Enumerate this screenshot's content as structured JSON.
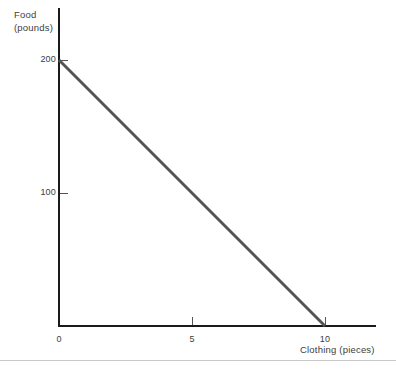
{
  "chart_data": {
    "type": "line",
    "title": "",
    "subtitle": "",
    "xlabel": "Clothing (pieces)",
    "ylabel": "Food (pounds)",
    "ylabel_lines": [
      "Food",
      "(pounds)"
    ],
    "xlim": [
      0,
      12
    ],
    "ylim": [
      0,
      245
    ],
    "xticks": [
      0,
      5,
      10
    ],
    "xtick_labels": [
      "0",
      "5",
      "10"
    ],
    "yticks": [
      100,
      200
    ],
    "ytick_labels": [
      "100",
      "200"
    ],
    "grid": false,
    "legend": "none",
    "series": [
      {
        "name": "Budget constraint",
        "color": "#555555",
        "width": 3,
        "x": [
          0,
          10
        ],
        "y": [
          200,
          0
        ],
        "points": [
          {
            "x": 0,
            "y": 200
          },
          {
            "x": 10,
            "y": 0
          }
        ]
      }
    ],
    "annotations": []
  },
  "axes": {
    "y_title_line1": "Food",
    "y_title_line2": "(pounds)",
    "x_title": "Clothing (pieces)",
    "axis_color": "#1a1a1a",
    "tick_color": "#555555",
    "text_color": "#3d3d3d"
  },
  "footer": {
    "rule_color": "#c9c9c9"
  }
}
